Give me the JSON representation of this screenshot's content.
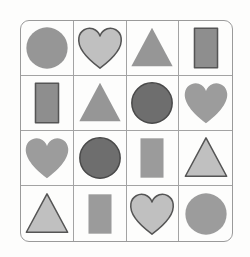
{
  "figure": {
    "background_color": "#fdfdfc",
    "frame_color": "#9a9a9a",
    "gridline_color": "#a3a3a3",
    "rows": 4,
    "columns": 4
  },
  "palette": {
    "medium_gray": "#969696",
    "dark_gray": "#6e6e6e",
    "light_gray": "#c8c8c8",
    "outline_dark": "#555555",
    "outline_medium": "#707070"
  },
  "cells": [
    {
      "row": 1,
      "column": 1,
      "shape": "circle",
      "icon": "circle-icon",
      "fill": "#969696",
      "stroke": "none",
      "stroke_width": 0,
      "size": "large"
    },
    {
      "row": 1,
      "column": 2,
      "shape": "heart",
      "icon": "heart-icon",
      "fill": "#c0c0c0",
      "stroke": "#555555",
      "stroke_width": 2,
      "size": "large"
    },
    {
      "row": 1,
      "column": 3,
      "shape": "triangle",
      "icon": "triangle-icon",
      "fill": "#969696",
      "stroke": "none",
      "stroke_width": 0,
      "size": "large"
    },
    {
      "row": 1,
      "column": 4,
      "shape": "rectangle",
      "icon": "rectangle-icon",
      "fill": "#8e8e8e",
      "stroke": "#555555",
      "stroke_width": 2,
      "size": "medium"
    },
    {
      "row": 2,
      "column": 1,
      "shape": "rectangle",
      "icon": "rectangle-icon",
      "fill": "#8e8e8e",
      "stroke": "#555555",
      "stroke_width": 2,
      "size": "medium"
    },
    {
      "row": 2,
      "column": 2,
      "shape": "triangle",
      "icon": "triangle-icon",
      "fill": "#969696",
      "stroke": "none",
      "stroke_width": 0,
      "size": "large"
    },
    {
      "row": 2,
      "column": 3,
      "shape": "circle",
      "icon": "circle-icon",
      "fill": "#6e6e6e",
      "stroke": "#4a4a4a",
      "stroke_width": 2,
      "size": "large"
    },
    {
      "row": 2,
      "column": 4,
      "shape": "heart",
      "icon": "heart-icon",
      "fill": "#9c9c9c",
      "stroke": "none",
      "stroke_width": 0,
      "size": "large"
    },
    {
      "row": 3,
      "column": 1,
      "shape": "heart",
      "icon": "heart-icon",
      "fill": "#9c9c9c",
      "stroke": "none",
      "stroke_width": 0,
      "size": "large"
    },
    {
      "row": 3,
      "column": 2,
      "shape": "circle",
      "icon": "circle-icon",
      "fill": "#6e6e6e",
      "stroke": "#4a4a4a",
      "stroke_width": 2,
      "size": "large"
    },
    {
      "row": 3,
      "column": 3,
      "shape": "rectangle",
      "icon": "rectangle-icon",
      "fill": "#9b9b9b",
      "stroke": "none",
      "stroke_width": 0,
      "size": "medium"
    },
    {
      "row": 3,
      "column": 4,
      "shape": "triangle",
      "icon": "triangle-icon",
      "fill": "#c0c0c0",
      "stroke": "#555555",
      "stroke_width": 2,
      "size": "large"
    },
    {
      "row": 4,
      "column": 1,
      "shape": "triangle",
      "icon": "triangle-icon",
      "fill": "#c0c0c0",
      "stroke": "#555555",
      "stroke_width": 2,
      "size": "large"
    },
    {
      "row": 4,
      "column": 2,
      "shape": "rectangle",
      "icon": "rectangle-icon",
      "fill": "#9b9b9b",
      "stroke": "none",
      "stroke_width": 0,
      "size": "medium"
    },
    {
      "row": 4,
      "column": 3,
      "shape": "heart",
      "icon": "heart-icon",
      "fill": "#c0c0c0",
      "stroke": "#555555",
      "stroke_width": 2,
      "size": "large"
    },
    {
      "row": 4,
      "column": 4,
      "shape": "circle",
      "icon": "circle-icon",
      "fill": "#9c9c9c",
      "stroke": "none",
      "stroke_width": 0,
      "size": "large"
    }
  ]
}
